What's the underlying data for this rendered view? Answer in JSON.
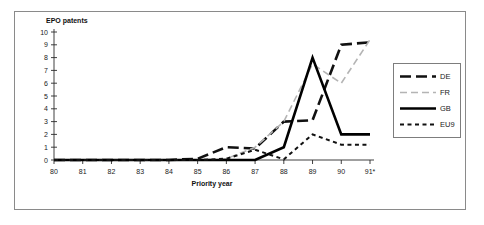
{
  "chart_data": {
    "type": "line",
    "title": "",
    "ylabel": "EPO patents",
    "xlabel": "Priority year",
    "categories": [
      "80",
      "81",
      "82",
      "83",
      "84",
      "85",
      "86",
      "87",
      "88",
      "89",
      "90",
      "91*"
    ],
    "ylim": [
      0,
      10
    ],
    "yticks": [
      "0",
      "1",
      "2",
      "3",
      "4",
      "5",
      "6",
      "7",
      "8",
      "9",
      "10"
    ],
    "grid": false,
    "legend_position": "right",
    "footnote_marker": "*",
    "series": [
      {
        "name": "DE",
        "color": "#111111",
        "style": "long-dash",
        "width": 2.6,
        "values": [
          0,
          0,
          0,
          0,
          0,
          0.1,
          1.0,
          0.9,
          3.0,
          3.1,
          9.0,
          9.2
        ]
      },
      {
        "name": "FR",
        "color": "#b4b4b4",
        "style": "dash",
        "width": 1.6,
        "values": [
          0,
          0,
          0,
          0,
          0,
          0,
          0.1,
          1.0,
          3.0,
          7.5,
          6.0,
          9.4
        ]
      },
      {
        "name": "GB",
        "color": "#000000",
        "style": "solid",
        "width": 2.6,
        "values": [
          0,
          0,
          0,
          0,
          0,
          0,
          0,
          0,
          1.0,
          8.0,
          2.0,
          2.0
        ]
      },
      {
        "name": "EU9",
        "color": "#111111",
        "style": "short-dash",
        "width": 2.0,
        "values": [
          0,
          0,
          0,
          0,
          0,
          0,
          0.1,
          0.8,
          0.05,
          2.0,
          1.2,
          1.2
        ]
      }
    ]
  },
  "legend": {
    "items": [
      {
        "label": "DE"
      },
      {
        "label": "FR"
      },
      {
        "label": "GB"
      },
      {
        "label": "EU9"
      }
    ]
  }
}
